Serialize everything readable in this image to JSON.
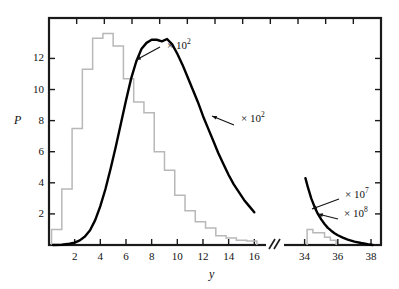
{
  "figure": {
    "axis_labels": {
      "x": "y",
      "y": "P"
    },
    "x_ticks_left": [
      "2",
      "4",
      "6",
      "8",
      "10",
      "12",
      "14",
      "16"
    ],
    "x_ticks_right": [
      "34",
      "36",
      "38"
    ],
    "y_ticks": [
      "2",
      "4",
      "6",
      "8",
      "10",
      "12"
    ],
    "break_marker": "//"
  },
  "annotations": [
    {
      "id": "ann-hist-left",
      "text_base": "× 10",
      "exponent": "2"
    },
    {
      "id": "ann-curve-left",
      "text_base": "× 10",
      "exponent": "2"
    },
    {
      "id": "ann-curve-right",
      "text_base": "× 10",
      "exponent": "7"
    },
    {
      "id": "ann-hist-right",
      "text_base": "× 10",
      "exponent": "8"
    }
  ],
  "chart_data": {
    "type": "line",
    "title": "",
    "xlabel": "y",
    "ylabel": "P",
    "xlim_left": [
      0,
      16.6
    ],
    "xlim_right": [
      33.0,
      38.6
    ],
    "ylim": [
      0,
      14.6
    ],
    "grid": false,
    "legend": "none",
    "axis_break": {
      "between": [
        16.6,
        33.0
      ],
      "marker": "//"
    },
    "series": [
      {
        "name": "histogram-left",
        "type": "bar",
        "scale_label": "× 10^2",
        "color": "#b8b8b8",
        "bin_width": 0.8,
        "bin_edges": [
          0.2,
          1.0,
          1.8,
          2.6,
          3.4,
          4.2,
          5.0,
          5.8,
          6.6,
          7.4,
          8.2,
          9.0,
          9.8,
          10.6,
          11.4,
          12.2,
          13.0,
          13.8,
          14.6,
          15.4,
          16.2
        ],
        "values": [
          1.0,
          3.6,
          7.5,
          11.3,
          13.3,
          13.6,
          12.8,
          10.7,
          9.2,
          8.5,
          6.0,
          4.8,
          3.2,
          2.2,
          1.5,
          1.1,
          0.6,
          0.45,
          0.3,
          0.25
        ]
      },
      {
        "name": "curve-left",
        "type": "line",
        "scale_label": "× 10^2",
        "color": "#000000",
        "x": [
          0.3,
          1.0,
          1.6,
          2.0,
          2.4,
          2.8,
          3.2,
          3.6,
          4.0,
          4.4,
          4.8,
          5.2,
          5.6,
          6.0,
          6.4,
          6.8,
          7.2,
          7.6,
          8.0,
          8.4,
          8.8,
          9.2,
          9.6,
          10.0,
          10.4,
          10.8,
          11.2,
          11.6,
          12.0,
          12.4,
          12.8,
          13.2,
          13.6,
          14.0,
          14.4,
          14.8,
          15.2,
          15.6,
          16.0
        ],
        "y": [
          0.0,
          0.02,
          0.08,
          0.15,
          0.3,
          0.55,
          0.95,
          1.6,
          2.5,
          3.6,
          4.9,
          6.3,
          7.8,
          9.3,
          10.7,
          11.8,
          12.6,
          13.0,
          13.2,
          13.2,
          13.1,
          13.25,
          12.9,
          12.3,
          11.6,
          10.8,
          10.0,
          9.2,
          8.3,
          7.5,
          6.7,
          5.9,
          5.2,
          4.5,
          3.9,
          3.4,
          2.9,
          2.5,
          2.1
        ]
      },
      {
        "name": "curve-right",
        "type": "line",
        "scale_label": "× 10^7",
        "color": "#000000",
        "x": [
          34.05,
          34.2,
          34.4,
          34.6,
          34.8,
          35.0,
          35.2,
          35.4,
          35.6,
          35.8,
          36.0,
          36.3,
          36.6,
          37.0,
          37.4,
          37.8,
          38.1
        ],
        "y": [
          4.3,
          3.7,
          3.0,
          2.45,
          2.0,
          1.65,
          1.35,
          1.1,
          0.92,
          0.76,
          0.63,
          0.47,
          0.35,
          0.22,
          0.13,
          0.05,
          0.0
        ]
      },
      {
        "name": "histogram-right",
        "type": "bar",
        "scale_label": "× 10^8",
        "color": "#b8b8b8",
        "bin_width": 0.35,
        "bin_edges": [
          34.15,
          34.5,
          34.85,
          35.2,
          35.55,
          35.9
        ],
        "values": [
          1.0,
          0.78,
          0.78,
          0.5,
          0.3
        ]
      }
    ]
  }
}
